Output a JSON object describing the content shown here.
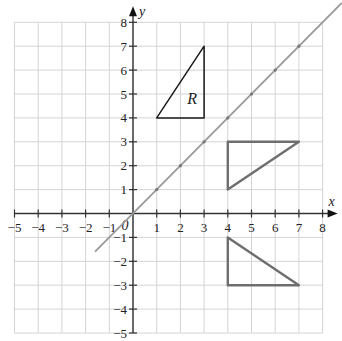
{
  "chart_data": {
    "type": "scatter",
    "title": "",
    "xlabel": "x",
    "ylabel": "y",
    "xlim": [
      -5,
      8
    ],
    "ylim": [
      -5,
      8
    ],
    "grid": true,
    "x_ticks": [
      -5,
      -4,
      -3,
      -2,
      -1,
      0,
      1,
      2,
      3,
      4,
      5,
      6,
      7,
      8
    ],
    "y_ticks": [
      -5,
      -4,
      -3,
      -2,
      -1,
      1,
      2,
      3,
      4,
      5,
      6,
      7,
      8
    ],
    "origin_label": "0",
    "line": {
      "name": "y = x",
      "from": [
        -1.6,
        -1.6
      ],
      "to": [
        8.8,
        8.8
      ],
      "marked_points": [
        [
          1,
          1
        ],
        [
          2,
          2
        ],
        [
          3,
          3
        ],
        [
          4,
          4
        ],
        [
          5,
          5
        ],
        [
          6,
          6
        ],
        [
          7,
          7
        ]
      ],
      "color": "#9a9a9a"
    },
    "shapes": [
      {
        "name": "R",
        "label": "R",
        "vertices": [
          [
            1,
            4
          ],
          [
            3,
            4
          ],
          [
            3,
            7
          ]
        ],
        "color": "#1a1a1a",
        "label_pos": [
          2.5,
          4.6
        ]
      },
      {
        "name": "image-1",
        "label": "",
        "vertices": [
          [
            4,
            3
          ],
          [
            7,
            3
          ],
          [
            4,
            1
          ]
        ],
        "color": "#6e6e6e"
      },
      {
        "name": "image-2",
        "label": "",
        "vertices": [
          [
            4,
            -1
          ],
          [
            4,
            -3
          ],
          [
            7,
            -3
          ]
        ],
        "color": "#6e6e6e"
      }
    ]
  }
}
